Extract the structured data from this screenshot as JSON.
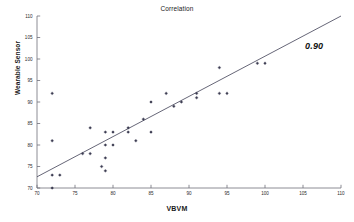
{
  "chart_data": {
    "type": "scatter",
    "title": "Correlation",
    "xlabel": "VBVM",
    "ylabel": "Wearable Sensor",
    "xlim": [
      70,
      110
    ],
    "ylim": [
      70,
      110
    ],
    "xticks": [
      70,
      75,
      80,
      85,
      90,
      95,
      100,
      105,
      110
    ],
    "yticks": [
      70,
      75,
      80,
      85,
      90,
      95,
      100,
      105,
      110
    ],
    "grid": false,
    "legend": null,
    "marker_color": "#3d3d52",
    "line_color": "#4a4a5e",
    "annotations": [
      {
        "text": "0.90",
        "x": 104.5,
        "y": 104.2,
        "style": "bold-italic",
        "meaning": "pearson-correlation-coefficient"
      }
    ],
    "trendline": {
      "type": "linear-fit",
      "x_start": 70,
      "y_start": 72.6,
      "x_end": 110,
      "y_end": 110.0,
      "slope": 0.935,
      "intercept": 7.15
    },
    "points": [
      {
        "x": 72,
        "y": 70
      },
      {
        "x": 72,
        "y": 73
      },
      {
        "x": 73,
        "y": 73
      },
      {
        "x": 72,
        "y": 81
      },
      {
        "x": 72,
        "y": 92
      },
      {
        "x": 76,
        "y": 78
      },
      {
        "x": 77,
        "y": 78
      },
      {
        "x": 77,
        "y": 84
      },
      {
        "x": 78.5,
        "y": 75
      },
      {
        "x": 79,
        "y": 77
      },
      {
        "x": 79,
        "y": 83
      },
      {
        "x": 79,
        "y": 74
      },
      {
        "x": 79,
        "y": 80
      },
      {
        "x": 80,
        "y": 80
      },
      {
        "x": 80,
        "y": 83
      },
      {
        "x": 82,
        "y": 83
      },
      {
        "x": 82,
        "y": 84
      },
      {
        "x": 83,
        "y": 81
      },
      {
        "x": 84,
        "y": 86
      },
      {
        "x": 85,
        "y": 83
      },
      {
        "x": 85,
        "y": 90
      },
      {
        "x": 87,
        "y": 92
      },
      {
        "x": 88,
        "y": 89
      },
      {
        "x": 89,
        "y": 90
      },
      {
        "x": 91,
        "y": 91
      },
      {
        "x": 91,
        "y": 92
      },
      {
        "x": 94,
        "y": 92
      },
      {
        "x": 94,
        "y": 98
      },
      {
        "x": 95,
        "y": 92
      },
      {
        "x": 99,
        "y": 99
      },
      {
        "x": 100,
        "y": 99
      }
    ]
  }
}
